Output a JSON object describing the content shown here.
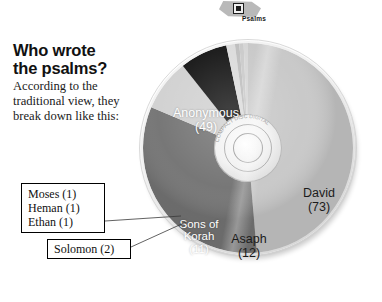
{
  "tag": {
    "label": "Psalms",
    "icon": "square-dot-icon"
  },
  "headline": "Who wrote\nthe psalms?",
  "subcopy": "According to the traditional view, they break down like this:",
  "callouts": [
    {
      "lines": [
        "Moses (1)",
        "Heman (1)",
        "Ethan (1)"
      ]
    },
    {
      "lines": [
        "Solomon (2)"
      ]
    }
  ],
  "chart_data": {
    "type": "pie",
    "subtitle": "According to the traditional view, they break down like this:",
    "unit": "psalms",
    "total": 150,
    "legend": "none",
    "categories": [
      "David",
      "Anonymous",
      "Asaph",
      "Sons of Korah",
      "Solomon",
      "Moses",
      "Heman",
      "Ethan"
    ],
    "values": [
      73,
      49,
      12,
      11,
      2,
      1,
      1,
      1
    ],
    "labels": [
      "David\n(73)",
      "Anonymous\n(49)",
      "Asaph\n(12)",
      "Sons of\nKorah\n(11)",
      "Solomon (2)",
      "Moses (1)",
      "Heman (1)",
      "Ethan (1)"
    ],
    "colors": [
      "#c9c9c9",
      "#777777",
      "#d2d2d2",
      "#1a1a1a",
      "#dcdcdc",
      "#bfbfbf",
      "#cbcbcb",
      "#d6d6d6"
    ],
    "callout_categories": [
      "Moses",
      "Heman",
      "Ethan",
      "Solomon"
    ],
    "inside_labels": [
      "David",
      "Anonymous",
      "Asaph",
      "Sons of Korah"
    ]
  },
  "slice_labels": {
    "anonymous": {
      "name": "Anonymous",
      "value": "(49)"
    },
    "david": {
      "name": "David",
      "value": "(73)"
    },
    "asaph": {
      "name": "Asaph",
      "value": "(12)"
    },
    "korah": {
      "name": "Sons of",
      "name2": "Korah",
      "value": "(11)"
    }
  }
}
